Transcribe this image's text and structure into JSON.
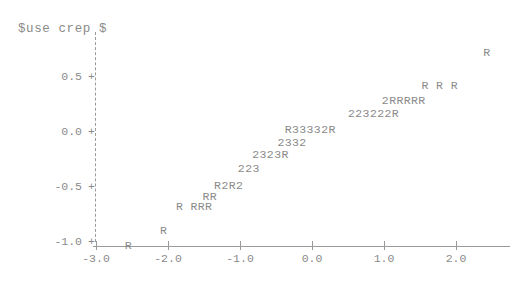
{
  "chart_data": {
    "type": "scatter",
    "title": "$use crep $",
    "subtitle": "",
    "xlabel": "",
    "ylabel": "",
    "xlim": [
      -3.0,
      2.55
    ],
    "ylim": [
      -1.12,
      0.78
    ],
    "grid": false,
    "legend": null,
    "axis_style": "character-plot",
    "y_axis_line_style": "dashed",
    "tick_glyph": "+",
    "xticks": [
      -3.0,
      -2.0,
      -1.0,
      0.0,
      1.0,
      2.0
    ],
    "xticklabels": [
      "-3.0",
      "-2.0",
      "-1.0",
      "0.0",
      "1.0",
      "2.0"
    ],
    "yticks": [
      0.5,
      0.0,
      -0.5,
      -1.0
    ],
    "yticklabels": [
      "0.5",
      "0.0",
      "-0.5",
      "-1.0"
    ],
    "marker_encoding": "character count codes: R=1 point, 2=2 points, 3=3 points",
    "points": [
      {
        "label": "R",
        "x": -2.6,
        "y": -1.04
      },
      {
        "label": "R",
        "x": -2.11,
        "y": -0.9
      },
      {
        "label": "R RRR",
        "x": -1.89,
        "y": -0.68
      },
      {
        "label": "RR",
        "x": -1.52,
        "y": -0.59
      },
      {
        "label": "R2R2",
        "x": -1.36,
        "y": -0.49
      },
      {
        "label": "223",
        "x": -1.03,
        "y": -0.34
      },
      {
        "label": "2323R",
        "x": -0.83,
        "y": -0.21
      },
      {
        "label": "2332",
        "x": -0.48,
        "y": -0.1
      },
      {
        "label": "R33332R",
        "x": -0.38,
        "y": 0.02
      },
      {
        "label": "223222R",
        "x": 0.5,
        "y": 0.16
      },
      {
        "label": "2RRRRR",
        "x": 0.97,
        "y": 0.28
      },
      {
        "label": "R R R",
        "x": 1.52,
        "y": 0.42
      },
      {
        "label": "R",
        "x": 2.38,
        "y": 0.72
      }
    ]
  },
  "axes": {
    "y_ticks": [
      {
        "label": "0.5",
        "glyph": "+"
      },
      {
        "label": "0.0",
        "glyph": "+"
      },
      {
        "label": "-0.5",
        "glyph": "+"
      },
      {
        "label": "-1.0",
        "glyph": "+"
      }
    ],
    "x_ticks": [
      {
        "label": "-3.0"
      },
      {
        "label": "-2.0"
      },
      {
        "label": "-1.0"
      },
      {
        "label": "0.0"
      },
      {
        "label": "1.0"
      },
      {
        "label": "2.0"
      }
    ]
  },
  "colors": {
    "ink": "#8a8a8a",
    "axis": "#9a9a9a",
    "background": "#ffffff"
  }
}
